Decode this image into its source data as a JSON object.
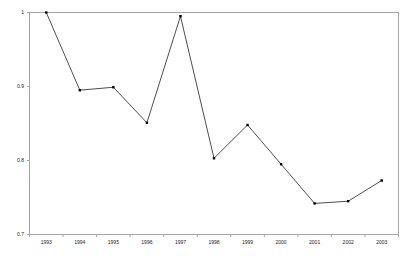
{
  "chart_data": {
    "type": "line",
    "title": "",
    "subtitle": "",
    "xlabel": "",
    "ylabel": "",
    "categories": [
      "1993",
      "1994",
      "1995",
      "1996",
      "1997",
      "1998",
      "1999",
      "2000",
      "2001",
      "2002",
      "2003"
    ],
    "values": [
      1.0,
      0.895,
      0.899,
      0.851,
      0.995,
      0.803,
      0.848,
      0.795,
      0.742,
      0.745,
      0.773
    ],
    "series": [
      {
        "name": "",
        "values": [
          1.0,
          0.895,
          0.899,
          0.851,
          0.995,
          0.803,
          0.848,
          0.795,
          0.742,
          0.745,
          0.773
        ]
      }
    ],
    "ylim": [
      0.7,
      1.0
    ],
    "y_ticks": [
      "0.7",
      "0.8",
      "0.9",
      "1"
    ],
    "y_tick_values": [
      0.7,
      0.8,
      0.9,
      1.0
    ],
    "x_ticks": [
      "1993",
      "1994",
      "1995",
      "1996",
      "1997",
      "1998",
      "1999",
      "2000",
      "2001",
      "2002",
      "2003"
    ],
    "grid": false,
    "legend": false,
    "legend_position": "none",
    "annotations": [],
    "marker": "square",
    "line_color": "#000000",
    "marker_color": "#000000",
    "axis_color": "#a6a6a6",
    "background_color": "#ffffff"
  }
}
